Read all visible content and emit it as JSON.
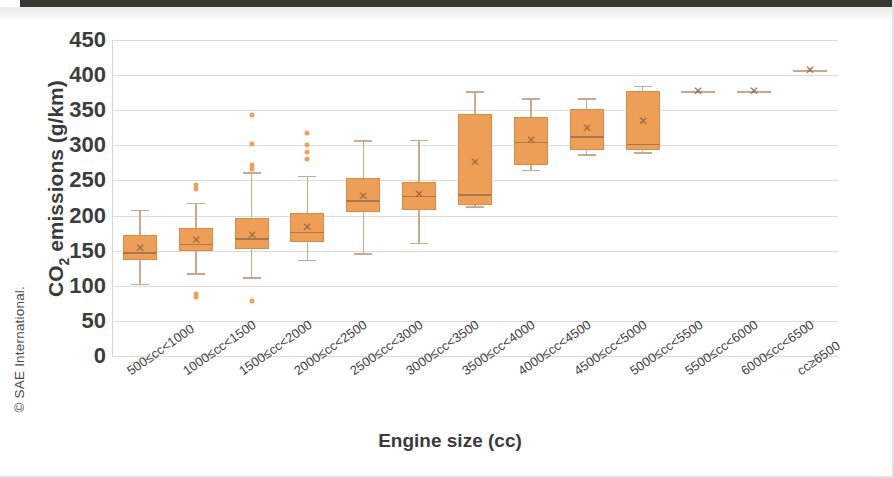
{
  "credit": "© SAE International.",
  "chart_data": {
    "type": "box",
    "title": "",
    "xlabel": "Engine size (cc)",
    "ylabel_html": "CO2 emissions (g/km)",
    "ylabel_main": "emissions (g/km)",
    "ylabel_prefix": "CO",
    "ylabel_sub": "2",
    "ylim": [
      0,
      450
    ],
    "yticks": [
      450,
      400,
      350,
      300,
      250,
      200,
      150,
      100,
      50,
      0
    ],
    "grid": true,
    "legend": "none",
    "accent_color": "#ee9f57",
    "box_edge_color": "#dd8b3f",
    "whisker_color": "#c9a98c",
    "categories": [
      "500≤cc<1000",
      "1000≤cc<1500",
      "1500≤cc<2000",
      "2000≤cc<2500",
      "2500≤cc<3000",
      "3000≤cc<3500",
      "3500≤cc<4000",
      "4000≤cc<4500",
      "4500≤cc<5000",
      "5000≤cc<5500",
      "5500≤cc<6000",
      "6000≤cc<6500",
      "cc≥6500"
    ],
    "boxes": [
      {
        "category": "500≤cc<1000",
        "whisker_low": 103,
        "q1": 137,
        "median": 148,
        "mean": 154,
        "q3": 172,
        "whisker_high": 208,
        "outliers": []
      },
      {
        "category": "1000≤cc<1500",
        "whisker_low": 118,
        "q1": 150,
        "median": 160,
        "mean": 165,
        "q3": 182,
        "whisker_high": 218,
        "outliers": [
          243,
          238,
          88,
          84
        ]
      },
      {
        "category": "1500≤cc<2000",
        "whisker_low": 112,
        "q1": 152,
        "median": 168,
        "mean": 173,
        "q3": 196,
        "whisker_high": 262,
        "outliers": [
          343,
          302,
          272,
          266,
          78
        ]
      },
      {
        "category": "2000≤cc<2500",
        "whisker_low": 137,
        "q1": 163,
        "median": 177,
        "mean": 183,
        "q3": 203,
        "whisker_high": 257,
        "outliers": [
          317,
          300,
          290,
          281
        ]
      },
      {
        "category": "2500≤cc<3000",
        "whisker_low": 146,
        "q1": 205,
        "median": 222,
        "mean": 228,
        "q3": 254,
        "whisker_high": 307,
        "outliers": []
      },
      {
        "category": "3000≤cc<3500",
        "whisker_low": 161,
        "q1": 208,
        "median": 228,
        "mean": 230,
        "q3": 248,
        "whisker_high": 308,
        "outliers": []
      },
      {
        "category": "3500≤cc<4000",
        "whisker_low": 213,
        "q1": 215,
        "median": 230,
        "mean": 276,
        "q3": 344,
        "whisker_high": 377,
        "outliers": []
      },
      {
        "category": "4000≤cc<4500",
        "whisker_low": 265,
        "q1": 272,
        "median": 305,
        "mean": 307,
        "q3": 341,
        "whisker_high": 367,
        "outliers": []
      },
      {
        "category": "4500≤cc<5000",
        "whisker_low": 287,
        "q1": 293,
        "median": 313,
        "mean": 324,
        "q3": 352,
        "whisker_high": 367,
        "outliers": []
      },
      {
        "category": "5000≤cc<5500",
        "whisker_low": 290,
        "q1": 293,
        "median": 302,
        "mean": 334,
        "q3": 378,
        "whisker_high": 385,
        "outliers": []
      },
      {
        "category": "5500≤cc<6000",
        "whisker_low": 377,
        "q1": 377,
        "median": 377,
        "mean": 377,
        "q3": 377,
        "whisker_high": 377,
        "outliers": []
      },
      {
        "category": "6000≤cc<6500",
        "whisker_low": 377,
        "q1": 377,
        "median": 377,
        "mean": 377,
        "q3": 377,
        "whisker_high": 377,
        "outliers": []
      },
      {
        "category": "cc≥6500",
        "whisker_low": 407,
        "q1": 407,
        "median": 407,
        "mean": 407,
        "q3": 407,
        "whisker_high": 407,
        "outliers": []
      }
    ]
  }
}
